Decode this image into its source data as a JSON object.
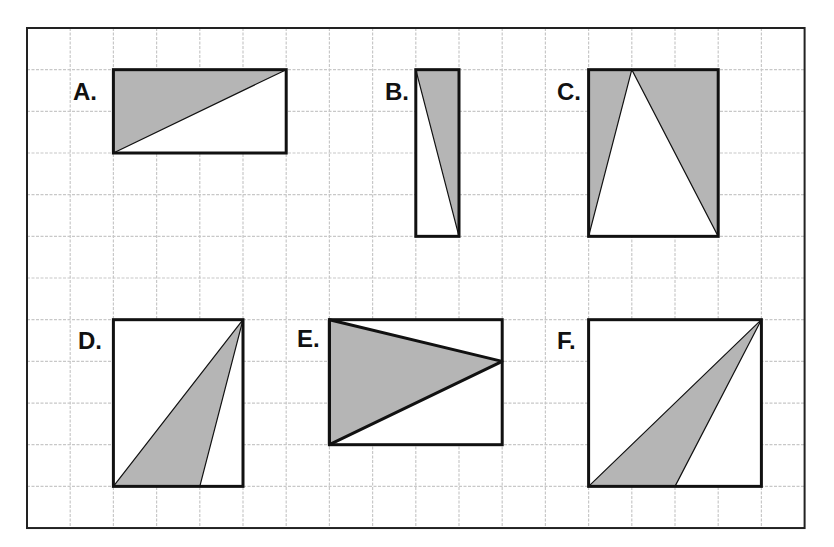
{
  "diagram": {
    "frame": {
      "x": 27,
      "y": 28,
      "cols": 18,
      "rows": 12,
      "cell_w": 43.2,
      "cell_h": 41.67
    },
    "colors": {
      "grid": "#c8c8c8",
      "frame": "#222222",
      "outline": "#111111",
      "shade": "#b5b5b5",
      "background": "#ffffff"
    },
    "figures": [
      {
        "id": "A",
        "label": "A.",
        "label_pos": {
          "x": 73,
          "y": 80
        },
        "rect": {
          "c0": 2,
          "r0": 1,
          "c1": 6,
          "r1": 3
        },
        "triangle": [
          [
            2,
            1
          ],
          [
            6,
            1
          ],
          [
            2,
            3
          ]
        ],
        "triangle_stroke": "thin"
      },
      {
        "id": "B",
        "label": "B.",
        "label_pos": {
          "x": 385,
          "y": 80
        },
        "rect": {
          "c0": 9,
          "r0": 1,
          "c1": 10,
          "r1": 5
        },
        "triangle": [
          [
            9,
            1
          ],
          [
            10,
            1
          ],
          [
            10,
            5
          ]
        ],
        "triangle_stroke": "thin"
      },
      {
        "id": "C",
        "label": "C.",
        "label_pos": {
          "x": 557,
          "y": 80
        },
        "rect": {
          "c0": 13,
          "r0": 1,
          "c1": 16,
          "r1": 5
        },
        "shaded_full": true,
        "white_triangle": [
          [
            14,
            1
          ],
          [
            13,
            5
          ],
          [
            16,
            5
          ]
        ],
        "triangle_stroke": "thin"
      },
      {
        "id": "D",
        "label": "D.",
        "label_pos": {
          "x": 78,
          "y": 329
        },
        "rect": {
          "c0": 2,
          "r0": 7,
          "c1": 5,
          "r1": 11
        },
        "triangle": [
          [
            2,
            11
          ],
          [
            5,
            7
          ],
          [
            4,
            11
          ]
        ],
        "triangle_stroke": "thin"
      },
      {
        "id": "E",
        "label": "E.",
        "label_pos": {
          "x": 297,
          "y": 327
        },
        "rect": {
          "c0": 7,
          "r0": 7,
          "c1": 11,
          "r1": 10
        },
        "triangle": [
          [
            7,
            7
          ],
          [
            11,
            8
          ],
          [
            7,
            10
          ]
        ],
        "triangle_stroke": "thick"
      },
      {
        "id": "F",
        "label": "F.",
        "label_pos": {
          "x": 557,
          "y": 329
        },
        "rect": {
          "c0": 13,
          "r0": 7,
          "c1": 17,
          "r1": 11
        },
        "triangle": [
          [
            13,
            11
          ],
          [
            17,
            7
          ],
          [
            15,
            11
          ]
        ],
        "triangle_stroke": "thin"
      }
    ]
  }
}
